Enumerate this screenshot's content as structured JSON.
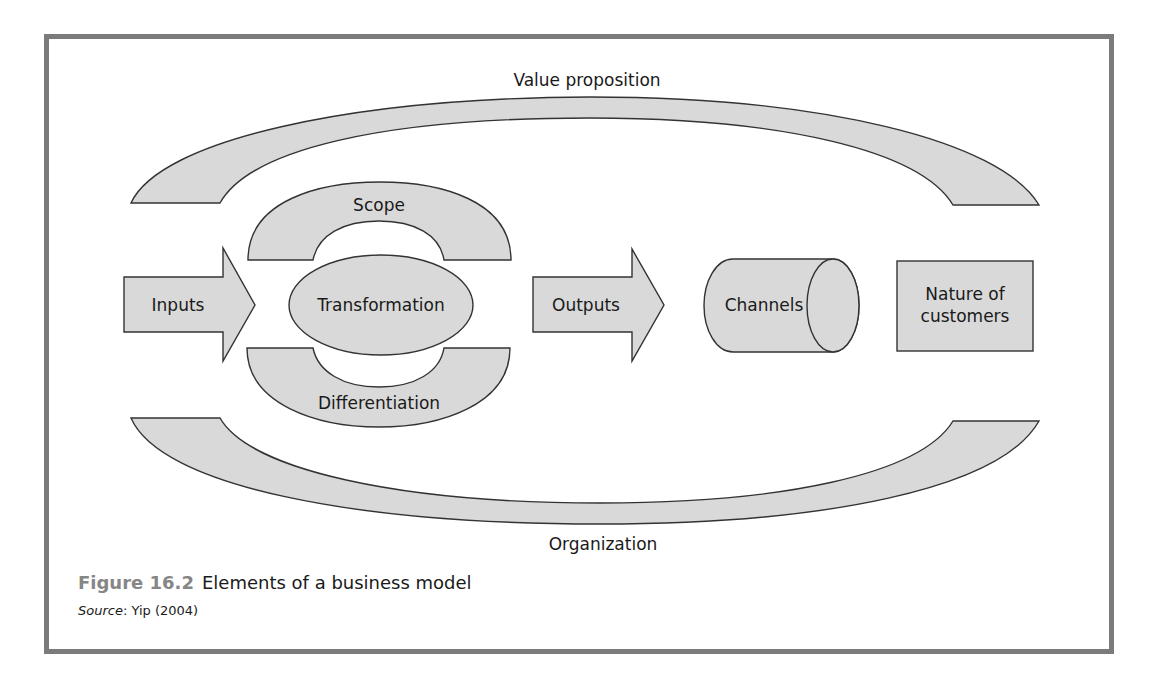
{
  "figure": {
    "number": "Figure 16.2",
    "title": "Elements of a business model",
    "source_label": "Source",
    "source_sep": ": ",
    "source_text": "Yip (2004)"
  },
  "diagram": {
    "arcs": {
      "top": "Value proposition",
      "bottom": "Organization"
    },
    "core": {
      "scope": "Scope",
      "transformation": "Transformation",
      "differentiation": "Differentiation"
    },
    "flow": {
      "inputs": "Inputs",
      "outputs": "Outputs",
      "channels": "Channels",
      "customers_line1": "Nature of",
      "customers_line2": "customers"
    }
  },
  "colors": {
    "shape_fill": "#d9d9d9",
    "shape_stroke": "#333333",
    "frame_border": "#7b7b7b",
    "figure_number": "#868686"
  }
}
